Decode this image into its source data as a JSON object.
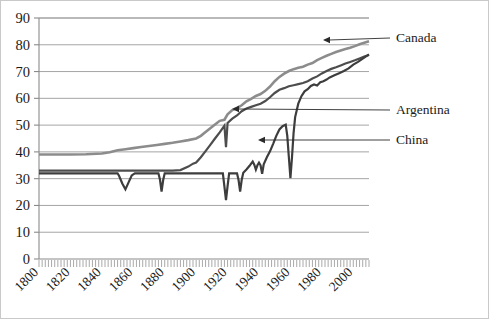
{
  "chart_data": {
    "type": "line",
    "title": "",
    "subtitle": "",
    "xlabel": "",
    "ylabel": "",
    "xlim": [
      1800,
      2010
    ],
    "ylim": [
      0,
      90
    ],
    "grid": true,
    "grid_axis": "y",
    "legend_position": "inline-annotations",
    "y_ticks": [
      0,
      10,
      20,
      30,
      40,
      50,
      60,
      70,
      80,
      90
    ],
    "y_tick_labels": [
      "0",
      "10",
      "20",
      "30",
      "40",
      "50",
      "60",
      "70",
      "80",
      "90"
    ],
    "x_ticks": [
      1800,
      1820,
      1840,
      1860,
      1880,
      1900,
      1920,
      1940,
      1960,
      1980,
      2000
    ],
    "x_tick_labels": [
      "1800",
      "1820",
      "1840",
      "1860",
      "1880",
      "1900",
      "1920",
      "1940",
      "1960",
      "1980",
      "2000"
    ],
    "x_minor_tick_interval": 2,
    "annotations": [
      {
        "label": "Canada",
        "series": "Canada",
        "arrow": true,
        "text_x": 395,
        "text_y": 41,
        "arrow_tip_x": 322,
        "arrow_tip_y": 39
      },
      {
        "label": "Argentina",
        "series": "Argentina",
        "arrow": true,
        "text_x": 395,
        "text_y": 113,
        "arrow_tip_x": 231,
        "arrow_tip_y": 108
      },
      {
        "label": "China",
        "series": "China",
        "arrow": true,
        "text_x": 395,
        "text_y": 143,
        "arrow_tip_x": 257,
        "arrow_tip_y": 139
      }
    ],
    "series": [
      {
        "name": "Canada",
        "color": "#8c8c8c",
        "stroke_width": 2.6,
        "points": [
          [
            1800,
            39.0
          ],
          [
            1810,
            39.0
          ],
          [
            1820,
            39.0
          ],
          [
            1830,
            39.1
          ],
          [
            1840,
            39.4
          ],
          [
            1845,
            39.9
          ],
          [
            1850,
            40.6
          ],
          [
            1855,
            41.0
          ],
          [
            1860,
            41.4
          ],
          [
            1865,
            41.8
          ],
          [
            1870,
            42.2
          ],
          [
            1875,
            42.6
          ],
          [
            1880,
            43.0
          ],
          [
            1885,
            43.4
          ],
          [
            1890,
            43.9
          ],
          [
            1895,
            44.4
          ],
          [
            1900,
            45.0
          ],
          [
            1903,
            46.0
          ],
          [
            1906,
            47.4
          ],
          [
            1909,
            48.8
          ],
          [
            1912,
            50.2
          ],
          [
            1915,
            51.6
          ],
          [
            1918,
            52.0
          ],
          [
            1920,
            54.0
          ],
          [
            1923,
            55.6
          ],
          [
            1926,
            56.4
          ],
          [
            1929,
            57.4
          ],
          [
            1932,
            58.9
          ],
          [
            1935,
            59.8
          ],
          [
            1938,
            60.9
          ],
          [
            1941,
            61.6
          ],
          [
            1944,
            62.8
          ],
          [
            1947,
            64.4
          ],
          [
            1950,
            66.4
          ],
          [
            1953,
            68.0
          ],
          [
            1956,
            69.2
          ],
          [
            1959,
            70.2
          ],
          [
            1962,
            70.9
          ],
          [
            1965,
            71.4
          ],
          [
            1968,
            71.8
          ],
          [
            1971,
            72.6
          ],
          [
            1974,
            73.2
          ],
          [
            1977,
            74.3
          ],
          [
            1980,
            75.1
          ],
          [
            1983,
            75.9
          ],
          [
            1986,
            76.6
          ],
          [
            1989,
            77.3
          ],
          [
            1992,
            77.9
          ],
          [
            1995,
            78.4
          ],
          [
            1998,
            78.9
          ],
          [
            2001,
            79.5
          ],
          [
            2004,
            80.2
          ],
          [
            2007,
            80.8
          ],
          [
            2010,
            81.3
          ]
        ]
      },
      {
        "name": "Argentina",
        "color": "#4d4d4d",
        "stroke_width": 2.2,
        "points": [
          [
            1800,
            33.0
          ],
          [
            1820,
            33.0
          ],
          [
            1840,
            33.0
          ],
          [
            1860,
            33.0
          ],
          [
            1875,
            33.0
          ],
          [
            1885,
            33.0
          ],
          [
            1890,
            33.2
          ],
          [
            1895,
            34.5
          ],
          [
            1898,
            35.6
          ],
          [
            1900,
            36.0
          ],
          [
            1903,
            38.0
          ],
          [
            1906,
            40.3
          ],
          [
            1909,
            42.6
          ],
          [
            1912,
            45.0
          ],
          [
            1915,
            47.3
          ],
          [
            1918,
            49.8
          ],
          [
            1919,
            41.8
          ],
          [
            1920,
            50.8
          ],
          [
            1923,
            52.4
          ],
          [
            1926,
            53.6
          ],
          [
            1929,
            55.2
          ],
          [
            1932,
            56.2
          ],
          [
            1935,
            56.8
          ],
          [
            1938,
            57.4
          ],
          [
            1941,
            58.0
          ],
          [
            1944,
            59.0
          ],
          [
            1947,
            60.4
          ],
          [
            1950,
            62.0
          ],
          [
            1953,
            63.2
          ],
          [
            1956,
            63.8
          ],
          [
            1959,
            64.5
          ],
          [
            1962,
            64.9
          ],
          [
            1965,
            65.3
          ],
          [
            1968,
            65.7
          ],
          [
            1971,
            66.4
          ],
          [
            1974,
            67.4
          ],
          [
            1977,
            68.2
          ],
          [
            1980,
            69.3
          ],
          [
            1983,
            70.2
          ],
          [
            1986,
            71.0
          ],
          [
            1989,
            71.6
          ],
          [
            1992,
            72.3
          ],
          [
            1995,
            73.0
          ],
          [
            1998,
            73.6
          ],
          [
            2001,
            74.2
          ],
          [
            2004,
            74.9
          ],
          [
            2007,
            75.6
          ],
          [
            2010,
            76.2
          ]
        ]
      },
      {
        "name": "China",
        "color": "#3d3d3d",
        "stroke_width": 2.2,
        "points": [
          [
            1800,
            32.0
          ],
          [
            1820,
            32.0
          ],
          [
            1840,
            32.0
          ],
          [
            1850,
            32.0
          ],
          [
            1851,
            31.0
          ],
          [
            1853,
            28.2
          ],
          [
            1855,
            26.0
          ],
          [
            1857,
            28.6
          ],
          [
            1859,
            31.2
          ],
          [
            1861,
            32.0
          ],
          [
            1870,
            32.0
          ],
          [
            1876,
            32.0
          ],
          [
            1877,
            29.6
          ],
          [
            1878,
            25.2
          ],
          [
            1879,
            29.4
          ],
          [
            1880,
            32.0
          ],
          [
            1890,
            32.0
          ],
          [
            1900,
            32.0
          ],
          [
            1910,
            32.0
          ],
          [
            1917,
            32.0
          ],
          [
            1918,
            27.0
          ],
          [
            1919,
            22.0
          ],
          [
            1920,
            27.2
          ],
          [
            1921,
            32.0
          ],
          [
            1926,
            32.0
          ],
          [
            1927,
            29.5
          ],
          [
            1928,
            25.2
          ],
          [
            1929,
            29.6
          ],
          [
            1930,
            32.2
          ],
          [
            1932,
            33.4
          ],
          [
            1934,
            34.8
          ],
          [
            1935,
            35.6
          ],
          [
            1936,
            36.4
          ],
          [
            1937,
            35.2
          ],
          [
            1938,
            33.4
          ],
          [
            1939,
            35.0
          ],
          [
            1940,
            36.0
          ],
          [
            1941,
            35.0
          ],
          [
            1942,
            31.8
          ],
          [
            1943,
            35.4
          ],
          [
            1945,
            38.0
          ],
          [
            1947,
            40.2
          ],
          [
            1949,
            43.0
          ],
          [
            1951,
            46.0
          ],
          [
            1953,
            48.4
          ],
          [
            1955,
            49.6
          ],
          [
            1957,
            50.2
          ],
          [
            1958,
            46.0
          ],
          [
            1959,
            38.0
          ],
          [
            1960,
            30.2
          ],
          [
            1961,
            38.0
          ],
          [
            1962,
            47.0
          ],
          [
            1963,
            53.0
          ],
          [
            1965,
            58.0
          ],
          [
            1967,
            60.8
          ],
          [
            1969,
            62.6
          ],
          [
            1971,
            63.4
          ],
          [
            1973,
            64.6
          ],
          [
            1975,
            65.2
          ],
          [
            1977,
            64.8
          ],
          [
            1979,
            66.0
          ],
          [
            1981,
            66.4
          ],
          [
            1983,
            67.0
          ],
          [
            1985,
            67.8
          ],
          [
            1988,
            68.6
          ],
          [
            1991,
            69.4
          ],
          [
            1994,
            70.2
          ],
          [
            1997,
            71.2
          ],
          [
            2000,
            72.6
          ],
          [
            2003,
            73.6
          ],
          [
            2006,
            74.8
          ],
          [
            2010,
            76.4
          ]
        ]
      }
    ]
  }
}
